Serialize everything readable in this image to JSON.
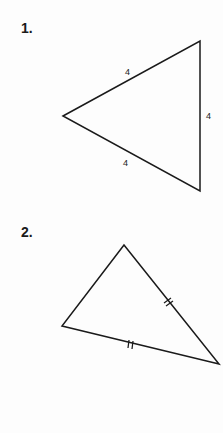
{
  "problems": [
    {
      "number": "1.",
      "figure": "equilateral-triangle",
      "side_labels": [
        "4",
        "4",
        "4"
      ]
    },
    {
      "number": "2.",
      "figure": "isosceles-triangle",
      "tick_marks": "double tick marks on two congruent sides"
    }
  ],
  "colors": {
    "line": "#1a1a1a",
    "background": "#fdfdfd"
  }
}
